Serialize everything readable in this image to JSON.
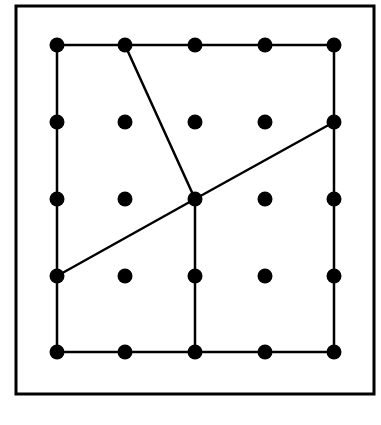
{
  "diagram": {
    "type": "geoboard",
    "grid": {
      "rows": 5,
      "cols": 5
    },
    "colors": {
      "ink": "#000000",
      "background": "#ffffff"
    },
    "frame": {
      "x": 16,
      "y": 6,
      "width": 358,
      "height": 388
    },
    "dot_columns_px": [
      57,
      125,
      195,
      265,
      334
    ],
    "dot_rows_px": [
      45,
      122,
      199,
      276,
      352
    ],
    "segments": [
      {
        "name": "square-top",
        "from": [
          0,
          0
        ],
        "to": [
          4,
          0
        ]
      },
      {
        "name": "square-right",
        "from": [
          4,
          0
        ],
        "to": [
          4,
          4
        ]
      },
      {
        "name": "square-bottom",
        "from": [
          4,
          4
        ],
        "to": [
          0,
          4
        ]
      },
      {
        "name": "square-left",
        "from": [
          0,
          4
        ],
        "to": [
          0,
          0
        ]
      },
      {
        "name": "segment-top-to-center",
        "from": [
          1,
          0
        ],
        "to": [
          2,
          2
        ]
      },
      {
        "name": "segment-left-to-center",
        "from": [
          0,
          3
        ],
        "to": [
          2,
          2
        ]
      },
      {
        "name": "segment-center-to-right",
        "from": [
          2,
          2
        ],
        "to": [
          4,
          1
        ]
      },
      {
        "name": "segment-center-to-bottom",
        "from": [
          2,
          2
        ],
        "to": [
          2,
          4
        ]
      }
    ],
    "regions": 4
  }
}
